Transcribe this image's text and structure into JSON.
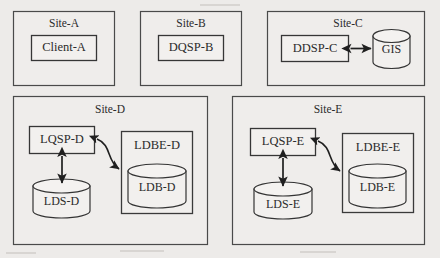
{
  "diagram": {
    "background_color": "#edebe9",
    "line_color": "#1f1f1f",
    "box_fill": "#f2f0ee",
    "sites": [
      {
        "id": "site-a",
        "label": "Site-A",
        "nodes": [
          {
            "id": "client-a",
            "label": "Client-A",
            "shape": "rect"
          }
        ],
        "connectors": []
      },
      {
        "id": "site-b",
        "label": "Site-B",
        "nodes": [
          {
            "id": "dqsp-b",
            "label": "DQSP-B",
            "shape": "rect"
          }
        ],
        "connectors": []
      },
      {
        "id": "site-c",
        "label": "Site-C",
        "nodes": [
          {
            "id": "ddsp-c",
            "label": "DDSP-C",
            "shape": "rect"
          },
          {
            "id": "gis",
            "label": "GIS",
            "shape": "cylinder"
          }
        ],
        "connectors": [
          {
            "from": "ddsp-c",
            "to": "gis",
            "style": "double-arrow-straight"
          }
        ]
      },
      {
        "id": "site-d",
        "label": "Site-D",
        "nodes": [
          {
            "id": "lqsp-d",
            "label": "LQSP-D",
            "shape": "rect"
          },
          {
            "id": "lds-d",
            "label": "LDS-D",
            "shape": "cylinder"
          },
          {
            "id": "ldbe-d",
            "label": "LDBE-D",
            "shape": "group-rect"
          },
          {
            "id": "ldb-d",
            "label": "LDB-D",
            "shape": "cylinder"
          }
        ],
        "connectors": [
          {
            "from": "lqsp-d",
            "to": "lds-d",
            "style": "double-arrow-vertical"
          },
          {
            "from": "lqsp-d",
            "to": "ldb-d",
            "style": "double-arrow-curved"
          }
        ]
      },
      {
        "id": "site-e",
        "label": "Site-E",
        "nodes": [
          {
            "id": "lqsp-e",
            "label": "LQSP-E",
            "shape": "rect"
          },
          {
            "id": "lds-e",
            "label": "LDS-E",
            "shape": "cylinder"
          },
          {
            "id": "ldbe-e",
            "label": "LDBE-E",
            "shape": "group-rect"
          },
          {
            "id": "ldb-e",
            "label": "LDB-E",
            "shape": "cylinder"
          }
        ],
        "connectors": [
          {
            "from": "lqsp-e",
            "to": "lds-e",
            "style": "double-arrow-vertical"
          },
          {
            "from": "lqsp-e",
            "to": "ldb-e",
            "style": "double-arrow-curved"
          }
        ]
      }
    ]
  }
}
